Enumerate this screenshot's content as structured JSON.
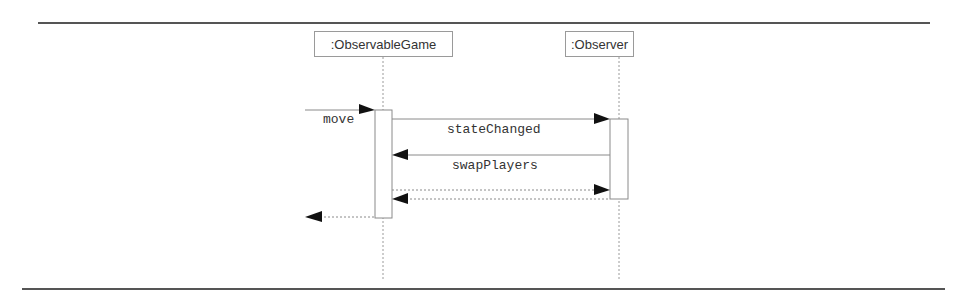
{
  "diagram": {
    "type": "sequence",
    "participants": [
      {
        "id": "game",
        "label": ":ObservableGame"
      },
      {
        "id": "observer",
        "label": ":Observer"
      }
    ],
    "messages": [
      {
        "label": "move",
        "from": "external",
        "to": "game",
        "style": "solid"
      },
      {
        "label": "stateChanged",
        "from": "game",
        "to": "observer",
        "style": "solid"
      },
      {
        "label": "swapPlayers",
        "from": "observer",
        "to": "game",
        "style": "solid"
      },
      {
        "label": "",
        "from": "game",
        "to": "observer",
        "style": "dashed-return"
      },
      {
        "label": "",
        "from": "observer",
        "to": "game",
        "style": "dashed-return"
      },
      {
        "label": "",
        "from": "game",
        "to": "external",
        "style": "dashed-return"
      }
    ],
    "colors": {
      "line": "#8a8a8a",
      "rule": "#555555",
      "arrowhead": "#111111",
      "text": "#333333"
    }
  }
}
